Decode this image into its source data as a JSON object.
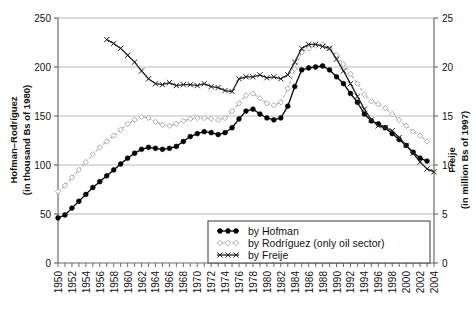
{
  "chart_data": {
    "type": "line",
    "title": "",
    "xlabel": "",
    "ylabel": "Hofman–Rodríguez (in thousand Bs of 1980)",
    "y2label": "Freije (in million Bs of 1997)",
    "ylim": [
      0,
      250
    ],
    "y2lim": [
      0,
      25
    ],
    "xlim": [
      1950,
      2004
    ],
    "grid": true,
    "legend_position": "lower-center-right",
    "y_ticks": [
      0,
      50,
      100,
      150,
      200,
      250
    ],
    "y2_ticks": [
      0,
      5,
      10,
      15,
      20,
      25
    ],
    "x_ticks": [
      1950,
      1952,
      1954,
      1956,
      1958,
      1960,
      1962,
      1964,
      1966,
      1968,
      1970,
      1972,
      1974,
      1976,
      1978,
      1980,
      1982,
      1984,
      1986,
      1988,
      1990,
      1992,
      1994,
      1996,
      1998,
      2000,
      2002,
      2004
    ],
    "x_all_years": [
      1950,
      1951,
      1952,
      1953,
      1954,
      1955,
      1956,
      1957,
      1958,
      1959,
      1960,
      1961,
      1962,
      1963,
      1964,
      1965,
      1966,
      1967,
      1968,
      1969,
      1970,
      1971,
      1972,
      1973,
      1974,
      1975,
      1976,
      1977,
      1978,
      1979,
      1980,
      1981,
      1982,
      1983,
      1984,
      1985,
      1986,
      1987,
      1988,
      1989,
      1990,
      1991,
      1992,
      1993,
      1994,
      1995,
      1996,
      1997,
      1998,
      1999,
      2000,
      2001,
      2002,
      2003,
      2004
    ],
    "series": [
      {
        "name": "by Hofman",
        "axis": "left",
        "color": "#000000",
        "marker": "filled-circle",
        "linestyle": "solid",
        "x": [
          1950,
          1951,
          1952,
          1953,
          1954,
          1955,
          1956,
          1957,
          1958,
          1959,
          1960,
          1961,
          1962,
          1963,
          1964,
          1965,
          1966,
          1967,
          1968,
          1969,
          1970,
          1971,
          1972,
          1973,
          1974,
          1975,
          1976,
          1977,
          1978,
          1979,
          1980,
          1981,
          1982,
          1983,
          1984,
          1985,
          1986,
          1987,
          1988,
          1989,
          1990,
          1991,
          1992,
          1993,
          1994,
          1995,
          1996,
          1997,
          1998,
          1999,
          2000,
          2001,
          2002,
          2003
        ],
        "y": [
          46,
          49,
          56,
          63,
          70,
          77,
          83,
          89,
          95,
          101,
          107,
          112,
          116,
          118,
          117,
          116,
          117,
          119,
          124,
          129,
          132,
          134,
          133,
          131,
          133,
          138,
          147,
          155,
          157,
          152,
          148,
          146,
          148,
          160,
          180,
          197,
          199,
          200,
          201,
          197,
          190,
          183,
          173,
          164,
          152,
          145,
          142,
          138,
          132,
          126,
          120,
          113,
          107,
          104
        ]
      },
      {
        "name": "by Rodríguez (only oil sector)",
        "axis": "left",
        "color": "#aaaaaa",
        "marker": "open-diamond",
        "linestyle": "dashed",
        "x": [
          1950,
          1951,
          1952,
          1953,
          1954,
          1955,
          1956,
          1957,
          1958,
          1959,
          1960,
          1961,
          1962,
          1963,
          1964,
          1965,
          1966,
          1967,
          1968,
          1969,
          1970,
          1971,
          1972,
          1973,
          1974,
          1975,
          1976,
          1977,
          1978,
          1979,
          1980,
          1981,
          1982,
          1983,
          1984,
          1985,
          1986,
          1987,
          1988,
          1989,
          1990,
          1991,
          1992,
          1993,
          1994,
          1995,
          1996,
          1997,
          1998,
          1999,
          2000,
          2001,
          2002,
          2003
        ],
        "y": [
          73,
          79,
          87,
          95,
          103,
          111,
          118,
          124,
          130,
          136,
          142,
          146,
          149,
          148,
          144,
          141,
          140,
          142,
          145,
          147,
          148,
          148,
          147,
          146,
          148,
          155,
          163,
          171,
          173,
          168,
          163,
          161,
          164,
          178,
          198,
          215,
          219,
          222,
          223,
          219,
          212,
          203,
          193,
          183,
          172,
          165,
          162,
          158,
          152,
          146,
          140,
          134,
          130,
          124
        ]
      },
      {
        "name": "by Freije",
        "axis": "right",
        "color": "#222222",
        "marker": "x-cross",
        "linestyle": "solid",
        "x": [
          1957,
          1958,
          1959,
          1960,
          1961,
          1962,
          1963,
          1964,
          1965,
          1966,
          1967,
          1968,
          1969,
          1970,
          1971,
          1972,
          1973,
          1974,
          1975,
          1976,
          1977,
          1978,
          1979,
          1980,
          1981,
          1982,
          1983,
          1984,
          1985,
          1986,
          1987,
          1988,
          1989,
          1990,
          1991,
          1992,
          1993,
          1994,
          1995,
          1996,
          1997,
          1998,
          1999,
          2000,
          2001,
          2002,
          2003,
          2004
        ],
        "y": [
          22.8,
          22.4,
          21.9,
          21.2,
          20.5,
          19.6,
          18.8,
          18.3,
          18.2,
          18.4,
          18.1,
          18.2,
          18.2,
          18.1,
          18.3,
          18.0,
          17.9,
          17.6,
          17.5,
          18.8,
          19.0,
          19.0,
          19.2,
          18.9,
          19.0,
          18.8,
          19.2,
          20.5,
          21.9,
          22.3,
          22.3,
          22.1,
          21.9,
          20.8,
          19.6,
          18.3,
          17.0,
          15.7,
          14.6,
          14.0,
          13.8,
          13.5,
          12.8,
          12.0,
          11.2,
          10.3,
          9.6,
          9.3
        ]
      }
    ]
  },
  "axes": {
    "left_title_line1": "Hofman–Rodríguez",
    "left_title_line2": "(in thousand Bs of 1980)",
    "right_title_line1": "Freije",
    "right_title_line2": "(in million Bs of 1997)"
  },
  "legend": {
    "items": [
      {
        "label": "by Hofman",
        "marker": "filled-circle"
      },
      {
        "label": "by Rodríguez (only oil sector)",
        "marker": "open-diamond"
      },
      {
        "label": "by Freije",
        "marker": "x-cross"
      }
    ]
  }
}
